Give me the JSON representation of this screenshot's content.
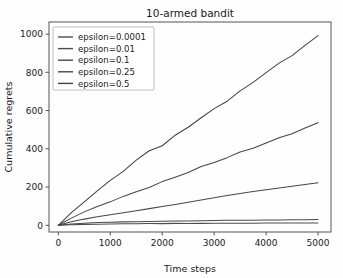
{
  "chart_data": {
    "type": "line",
    "title": "10-armed bandit",
    "xlabel": "Time steps",
    "ylabel": "Cumulative regrets",
    "xlim": [
      -180,
      5250
    ],
    "ylim": [
      -35,
      1063
    ],
    "xticks": [
      0,
      1000,
      2000,
      3000,
      4000,
      5000
    ],
    "yticks": [
      0,
      200,
      400,
      600,
      800,
      1000
    ],
    "xtick_labels": [
      "0",
      "1000",
      "2000",
      "3000",
      "4000",
      "5000"
    ],
    "ytick_labels": [
      "0",
      "200",
      "400",
      "600",
      "800",
      "1000"
    ],
    "grid": false,
    "legend_position": "upper left",
    "x": [
      0,
      250,
      500,
      750,
      1000,
      1250,
      1500,
      1750,
      2000,
      2250,
      2500,
      2750,
      3000,
      3250,
      3500,
      3750,
      4000,
      4250,
      4500,
      4750,
      5000
    ],
    "series": [
      {
        "name": "epsilon=0.0001",
        "color": "#4d4d4d",
        "values": [
          0,
          3,
          5,
          6,
          7,
          8,
          8,
          9,
          9,
          10,
          10,
          10,
          11,
          11,
          11,
          11,
          12,
          12,
          12,
          12,
          12
        ]
      },
      {
        "name": "epsilon=0.01",
        "color": "#4a4a4a",
        "values": [
          0,
          7,
          11,
          14,
          16,
          18,
          19,
          20,
          21,
          22,
          23,
          24,
          25,
          26,
          26,
          27,
          28,
          28,
          29,
          29,
          30
        ]
      },
      {
        "name": "epsilon=0.1",
        "color": "#484848",
        "values": [
          0,
          18,
          32,
          44,
          55,
          66,
          77,
          88,
          99,
          110,
          121,
          132,
          143,
          154,
          164,
          175,
          185,
          195,
          205,
          215,
          225
        ]
      },
      {
        "name": "epsilon=0.25",
        "color": "#454545",
        "values": [
          0,
          38,
          70,
          98,
          124,
          150,
          175,
          200,
          226,
          252,
          278,
          304,
          330,
          355,
          380,
          405,
          430,
          455,
          482,
          508,
          535
        ]
      },
      {
        "name": "epsilon=0.5",
        "color": "#424242",
        "values": [
          0,
          66,
          124,
          180,
          233,
          285,
          338,
          390,
          418,
          468,
          515,
          562,
          608,
          652,
          700,
          748,
          800,
          845,
          890,
          940,
          990
        ]
      }
    ]
  },
  "legend": {
    "entries": [
      {
        "label": "epsilon=0.0001"
      },
      {
        "label": "epsilon=0.01"
      },
      {
        "label": "epsilon=0.1"
      },
      {
        "label": "epsilon=0.25"
      },
      {
        "label": "epsilon=0.5"
      }
    ]
  }
}
